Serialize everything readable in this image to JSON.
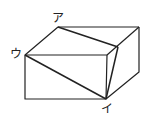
{
  "diagram": {
    "type": "cut rectangular prism (isometric sketch)",
    "labels": {
      "a": "ア",
      "i": "イ",
      "u": "ウ"
    },
    "stroke_color": "#222222",
    "background": "#ffffff"
  }
}
